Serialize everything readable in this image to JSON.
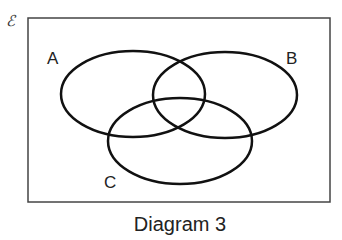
{
  "diagram": {
    "universal_symbol": "ℰ",
    "sets": [
      {
        "name": "A",
        "label": "A"
      },
      {
        "name": "B",
        "label": "B"
      },
      {
        "name": "C",
        "label": "C"
      }
    ],
    "caption": "Diagram 3"
  }
}
